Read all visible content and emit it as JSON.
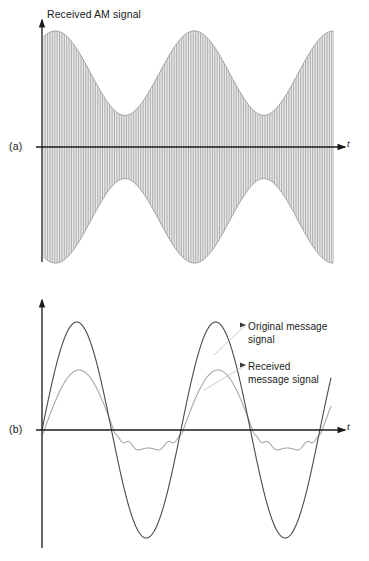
{
  "figure": {
    "background": "#ffffff",
    "ink_dark": "#3a3a3a",
    "ink_light": "#9a9a9a",
    "axis_color": "#1a1a1a"
  },
  "panel_a": {
    "panel_label": "(a)",
    "axis_title": "Received AM signal",
    "time_axis_label": "t",
    "origin": {
      "x": 42,
      "y": 147
    },
    "x_end": 345,
    "y_top": 20,
    "y_bottom": 262,
    "carrier_cycles": 84,
    "envelope_amplitude_px": 118,
    "envelope_min_px": 22
  },
  "panel_b": {
    "panel_label": "(b)",
    "time_axis_label": "t",
    "origin": {
      "x": 42,
      "y": 430
    },
    "x_end": 345,
    "y_top": 300,
    "y_bottom": 548,
    "annotations": [
      {
        "name": "original",
        "text": "Original message\nsignal",
        "x": 248,
        "y": 320
      },
      {
        "name": "received",
        "text": "Received\nmessage signal",
        "x": 248,
        "y": 360
      }
    ],
    "original_amplitude_px": 108,
    "received_amplitude_px": 60,
    "message_cycles": 2.08
  },
  "chart_data": {
    "type": "line",
    "panels": [
      {
        "id": "a",
        "label": "(a)",
        "title": "Received AM signal",
        "xlabel": "t",
        "ylabel": "",
        "series": [
          {
            "name": "Received AM signal",
            "description": "High-frequency carrier amplitude-modulated by |m(t)| style envelope with residual ripple in the troughs",
            "color": "#6e6e6e",
            "carrier_cycles": 84,
            "envelope_expression": "A_env(t) = 0.12 + 0.88*|cos(2*pi*1.04*t)|^1.0 with smoothing ripple",
            "envelope_peaks_normalized": [
              1.0,
              1.0
            ],
            "envelope_troughs_normalized": [
              0.2,
              0.2,
              0.2
            ]
          }
        ],
        "grid": false,
        "legend": "none"
      },
      {
        "id": "b",
        "label": "(b)",
        "title": "",
        "xlabel": "t",
        "ylabel": "",
        "series": [
          {
            "name": "Original message signal",
            "color": "#4a4a4a",
            "shape": "sine",
            "amplitude_normalized": 1.0,
            "cycles": 2.08,
            "phase_deg": 0
          },
          {
            "name": "Received message signal",
            "color": "#a8a8a8",
            "shape": "rectified-sine-with-ripple",
            "amplitude_normalized": 0.56,
            "cycles": 2.08,
            "phase_deg": 0,
            "note": "Positive half-cycles follow the message; negative half-cycles are clipped to a small rippled plateau (envelope-detector distortion)"
          }
        ],
        "grid": false,
        "legend": "annotations"
      }
    ],
    "xlim": [
      0,
      1
    ],
    "ylim": [
      -1.15,
      1.15
    ]
  }
}
